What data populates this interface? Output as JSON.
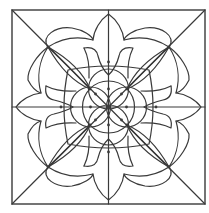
{
  "figure": {
    "stroke_color": "#3a3a3a",
    "background": "#ffffff",
    "center": [
      108.5,
      107
    ],
    "frame": {
      "x1": 12,
      "y1": 10,
      "x2": 205,
      "y2": 204
    },
    "lines": [
      {
        "name": "diagonal-tl-br",
        "x1": 12,
        "y1": 10,
        "x2": 205,
        "y2": 204
      },
      {
        "name": "diagonal-tr-bl",
        "x1": 205,
        "y1": 10,
        "x2": 12,
        "y2": 204
      },
      {
        "name": "vertical-center",
        "x1": 108.5,
        "y1": 10,
        "x2": 108.5,
        "y2": 204
      },
      {
        "name": "horizontal-center",
        "x1": 12,
        "y1": 107,
        "x2": 205,
        "y2": 107
      }
    ],
    "outer_flower_path": "M48,47 C40,36 56,26 72,28 C84,30 92,36 93,40 C94,30 100,20 108.5,14 C117,20 123,30 124,40 C125,36 133,30 145,28 C161,26 177,36 169,47 C180,55 190,70 189,80 C185,88 180,92 176,93 C186,94 196,100 201,107 C196,114 186,120 176,121 C180,122 185,126 189,134 C190,144 180,159 169,167 C177,178 161,188 145,186 C133,184 125,178 124,174 C123,184 117,194 108.5,200 C100,194 94,184 93,174 C92,178 84,184 72,186 C56,188 40,178 48,167 C37,159 27,144 28,134 C32,126 37,122 41,121 C31,120 21,114 16,107 C21,100 31,94 41,93 C37,92 32,88 28,80 C27,70 37,55 48,47 Z",
    "outer_circle_arcs": [
      "M48,47 A56,56 0 0 1 93,40",
      "M124,40 A56,56 0 0 1 169,47",
      "M169,47 A56,56 0 0 1 176,93",
      "M176,121 A56,56 0 0 1 169,167",
      "M169,167 A56,56 0 0 1 124,174",
      "M93,174 A56,56 0 0 1 48,167",
      "M48,167 A56,56 0 0 1 41,121",
      "M41,93 A56,56 0 0 1 48,47"
    ],
    "diagonal_lenses": [
      "M48,47 Q80,65 90,89 Q66,79 48,47 Z",
      "M48,47 Q74,72 90,89",
      "M169,47 Q137,65 127,89 Q151,79 169,47 Z",
      "M169,47 Q143,72 127,89",
      "M48,167 Q80,149 90,125 Q66,135 48,167 Z",
      "M48,167 Q74,142 90,125",
      "M169,167 Q137,149 127,125 Q151,135 169,167 Z",
      "M169,167 Q143,142 127,125"
    ],
    "inner_square_frame": "M68,70 Q108.5,62 149,70 Q157,107 149,144 Q108.5,152 68,144 Q60,107 68,70 Z",
    "inner_petals": [
      "M84,48 Q96,46 98,56 Q101,68 108.5,75 Q116,68 119,56 Q121,46 133,48 Q127,60 128,78",
      "M84,48 Q90,60 89,78",
      "M84,166 Q96,168 98,158 Q101,146 108.5,139 Q116,146 119,158 Q121,168 133,166 Q127,154 128,136",
      "M84,166 Q90,154 89,136",
      "M46,86 Q44,98 54,100 Q66,103 73,107 Q66,111 54,114 Q44,116 46,128 Q58,122 76,123",
      "M46,86 Q58,92 76,91",
      "M171,86 Q173,98 163,100 Q151,103 144,107 Q151,111 163,114 Q173,116 171,128 Q159,122 141,123",
      "M171,86 Q159,92 141,91"
    ],
    "center_circles": [
      {
        "cx": 108.5,
        "cy": 89,
        "r": 20
      },
      {
        "cx": 108.5,
        "cy": 125,
        "r": 20
      },
      {
        "cx": 90.5,
        "cy": 107,
        "r": 20
      },
      {
        "cx": 126.5,
        "cy": 107,
        "r": 20
      }
    ],
    "center_ring": {
      "cx": 108.5,
      "cy": 107,
      "r": 26
    },
    "dots": [
      [
        108.5,
        107
      ],
      [
        108.5,
        89
      ],
      [
        108.5,
        125
      ],
      [
        90.5,
        107
      ],
      [
        126.5,
        107
      ],
      [
        95.5,
        94
      ],
      [
        121.5,
        94
      ],
      [
        95.5,
        120
      ],
      [
        121.5,
        120
      ],
      [
        48,
        47
      ],
      [
        169,
        47
      ],
      [
        48,
        167
      ],
      [
        169,
        167
      ],
      [
        90,
        89
      ],
      [
        127,
        89
      ],
      [
        90,
        125
      ],
      [
        127,
        125
      ],
      [
        108.5,
        62
      ],
      [
        108.5,
        152
      ],
      [
        61,
        107
      ],
      [
        156,
        107
      ]
    ]
  }
}
